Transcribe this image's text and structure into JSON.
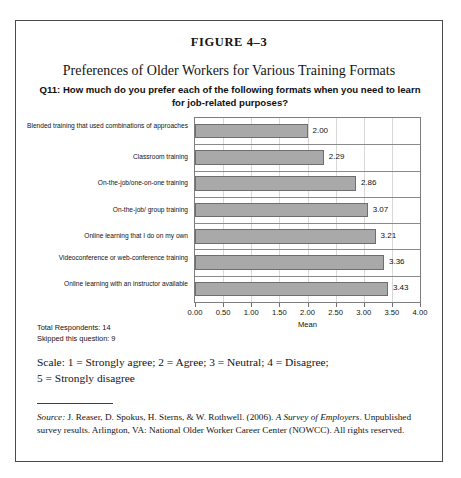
{
  "figure": {
    "number": "FIGURE 4–3",
    "title": "Preferences of Older Workers for Various Training Formats",
    "subtitle": "Q11: How much do you prefer each of the following formats when you need to learn for job-related purposes?"
  },
  "notes": {
    "total_respondents": "Total Respondents: 14",
    "skipped": "Skipped this question: 9",
    "scale_line1": "Scale: 1 = Strongly agree; 2 = Agree; 3 = Neutral; 4 = Disagree;",
    "scale_line2": "5 = Strongly disagree"
  },
  "source": {
    "label": "Source:",
    "text_before_italic": " J. Reaser, D. Spokus, H. Sterns, & W. Rothwell. (2006). ",
    "work_title": "A Survey of Employers",
    "text_after_italic": ". Unpublished survey results. Arlington, VA: National Older Worker Career Center (NOWCC). All rights reserved."
  },
  "colors": {
    "bar_fill": "#a9a9a9",
    "bar_border": "#6e6e6e",
    "frame": "#4a4a4a",
    "gridline": "#d8d8d8"
  },
  "chart_data": {
    "type": "bar",
    "orientation": "horizontal",
    "title": "Preferences of Older Workers for Various Training Formats",
    "subtitle": "Q11: How much do you prefer each of the following formats when you need to learn for job-related purposes?",
    "xlabel": "Mean",
    "ylabel": "",
    "xlim": [
      0,
      4
    ],
    "xticks": [
      "0.00",
      "0.50",
      "1.00",
      "1.50",
      "2.00",
      "2.50",
      "3.00",
      "3.50",
      "4.00"
    ],
    "xtick_values": [
      0,
      0.5,
      1,
      1.5,
      2,
      2.5,
      3,
      3.5,
      4
    ],
    "grid": true,
    "legend": "none",
    "categories": [
      "Blended training that used combinations of approaches",
      "Classroom training",
      "On-the-job/one-on-one training",
      "On-the-job/ group training",
      "Online learning that I do on my own",
      "Videoconference or web-conference training",
      "Online learning with an instructor available"
    ],
    "values": [
      2.0,
      2.29,
      2.86,
      3.07,
      3.21,
      3.36,
      3.43
    ],
    "value_labels": [
      "2.00",
      "2.29",
      "2.86",
      "3.07",
      "3.21",
      "3.36",
      "3.43"
    ]
  }
}
